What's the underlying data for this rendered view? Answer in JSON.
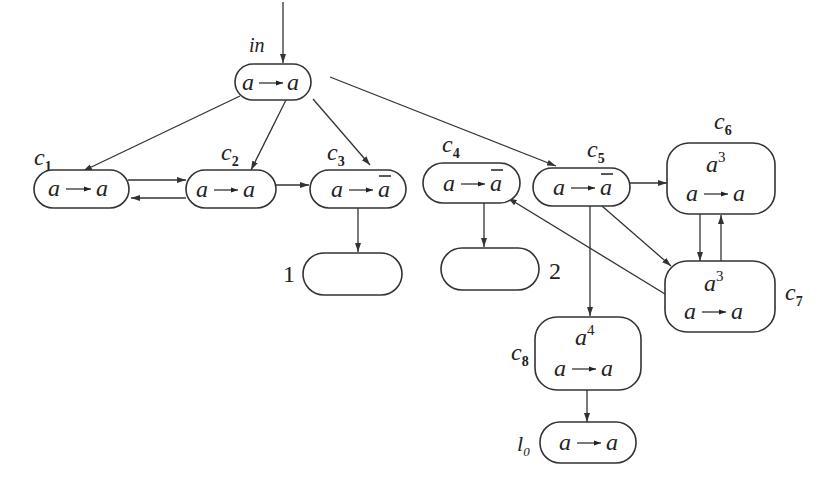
{
  "diagram": {
    "entry_label": "in",
    "nodes": {
      "in": {
        "top": "",
        "rule_left": "a",
        "rule_right": "a",
        "right_bar": false
      },
      "c1": {
        "name": "c",
        "sub": "1",
        "rule_left": "a",
        "rule_right": "a",
        "right_bar": false
      },
      "c2": {
        "name": "c",
        "sub": "2",
        "rule_left": "a",
        "rule_right": "a",
        "right_bar": false
      },
      "c3": {
        "name": "c",
        "sub": "3",
        "rule_left": "a",
        "rule_right": "a",
        "right_bar": true
      },
      "c4": {
        "name": "c",
        "sub": "4",
        "rule_left": "a",
        "rule_right": "a",
        "right_bar": true
      },
      "c5": {
        "name": "c",
        "sub": "5",
        "rule_left": "a",
        "rule_right": "a",
        "right_bar": true
      },
      "c6": {
        "name": "c",
        "sub": "6",
        "top_base": "a",
        "top_exp": "3",
        "rule_left": "a",
        "rule_right": "a"
      },
      "c7": {
        "name": "c",
        "sub": "7",
        "top_base": "a",
        "top_exp": "3",
        "rule_left": "a",
        "rule_right": "a"
      },
      "c8": {
        "name": "c",
        "sub": "8",
        "top_base": "a",
        "top_exp": "4",
        "rule_left": "a",
        "rule_right": "a"
      },
      "l0": {
        "name": "l",
        "sub": "0",
        "rule_left": "a",
        "rule_right": "a"
      },
      "t1": {
        "label": "1"
      },
      "t2": {
        "label": "2"
      }
    },
    "edges": [
      [
        "entry",
        "in"
      ],
      [
        "in",
        "c1"
      ],
      [
        "in",
        "c2"
      ],
      [
        "in",
        "c3"
      ],
      [
        "in",
        "c5"
      ],
      [
        "c1",
        "c2"
      ],
      [
        "c2",
        "c1"
      ],
      [
        "c2",
        "c3"
      ],
      [
        "c3",
        "t1"
      ],
      [
        "c4",
        "t2"
      ],
      [
        "c5",
        "c6"
      ],
      [
        "c5",
        "c7"
      ],
      [
        "c5",
        "c8"
      ],
      [
        "c6",
        "c7"
      ],
      [
        "c7",
        "c6"
      ],
      [
        "c7",
        "c4"
      ],
      [
        "c8",
        "l0"
      ]
    ]
  }
}
